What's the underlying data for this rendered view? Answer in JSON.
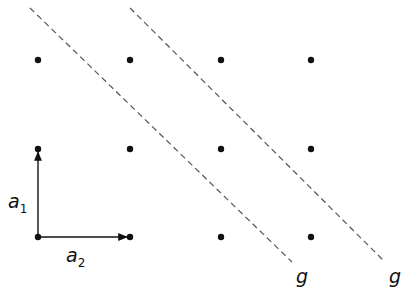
{
  "diagram": {
    "title": "",
    "lattice_points": [
      {
        "x": 38,
        "y": 60
      },
      {
        "x": 130,
        "y": 60
      },
      {
        "x": 221,
        "y": 60
      },
      {
        "x": 311,
        "y": 60
      },
      {
        "x": 38,
        "y": 149
      },
      {
        "x": 130,
        "y": 149
      },
      {
        "x": 221,
        "y": 149
      },
      {
        "x": 311,
        "y": 149
      },
      {
        "x": 38,
        "y": 237
      },
      {
        "x": 130,
        "y": 237
      },
      {
        "x": 221,
        "y": 237
      },
      {
        "x": 311,
        "y": 237
      }
    ],
    "vectors": [
      {
        "label": "a",
        "subscript": "1",
        "from": [
          38,
          237
        ],
        "to": [
          38,
          149
        ]
      },
      {
        "label": "a",
        "subscript": "2",
        "from": [
          38,
          237
        ],
        "to": [
          130,
          237
        ]
      }
    ],
    "lines": [
      {
        "label": "g",
        "from": [
          30,
          8
        ],
        "to": [
          292,
          262
        ]
      },
      {
        "label": "g",
        "from": [
          130,
          8
        ],
        "to": [
          385,
          262
        ]
      }
    ],
    "colors": {
      "ink": "#111111",
      "dash": "#555555"
    }
  }
}
